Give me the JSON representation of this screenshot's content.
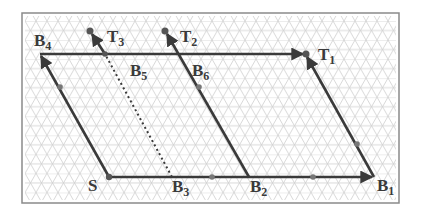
{
  "diagram": {
    "frame": {
      "x": 22,
      "y": 13,
      "width": 377,
      "height": 190
    },
    "colors": {
      "grid": "#c8c8c8",
      "line": "#3a3a3a",
      "dot": "#555555",
      "frame": "#8a8a8a",
      "label": "#3a3a3a"
    },
    "grid": {
      "type": "triangular",
      "spacing": 11
    },
    "points": {
      "S": {
        "x": 109,
        "y": 177
      },
      "B1": {
        "x": 374,
        "y": 177
      },
      "B2": {
        "x": 249,
        "y": 177
      },
      "B3": {
        "x": 172,
        "y": 177
      },
      "B4": {
        "x": 40,
        "y": 54
      },
      "B5": {
        "x": 105,
        "y": 54
      },
      "B6": {
        "x": 178,
        "y": 54
      },
      "T1": {
        "x": 306,
        "y": 54
      },
      "T2": {
        "x": 165,
        "y": 31
      },
      "T3": {
        "x": 90,
        "y": 31
      }
    },
    "labels": [
      {
        "id": "S",
        "main": "S",
        "sub": "",
        "x": 88,
        "y": 190
      },
      {
        "id": "B1",
        "main": "B",
        "sub": "1",
        "x": 377,
        "y": 191
      },
      {
        "id": "B2",
        "main": "B",
        "sub": "2",
        "x": 254,
        "y": 195
      },
      {
        "id": "B3",
        "main": "B",
        "sub": "3",
        "x": 172,
        "y": 195
      },
      {
        "id": "B4",
        "main": "B",
        "sub": "4",
        "x": 34,
        "y": 45
      },
      {
        "id": "B5",
        "main": "B",
        "sub": "5",
        "x": 130,
        "y": 76
      },
      {
        "id": "B6",
        "main": "B",
        "sub": "6",
        "x": 190,
        "y": 76
      },
      {
        "id": "T1",
        "main": "T",
        "sub": "1",
        "x": 318,
        "y": 60
      },
      {
        "id": "T2",
        "main": "T",
        "sub": "2",
        "x": 180,
        "y": 42
      },
      {
        "id": "T3",
        "main": "T",
        "sub": "3",
        "x": 107,
        "y": 42
      }
    ]
  }
}
